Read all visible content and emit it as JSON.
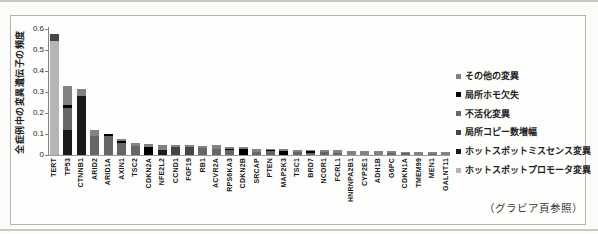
{
  "page": {
    "caption": "（グラビア頁参照）"
  },
  "chart_data": {
    "type": "bar",
    "stacked": true,
    "title": "",
    "xlabel": "",
    "ylabel": "全症例中の変異遺伝子の頻度",
    "ylim": [
      0,
      0.6
    ],
    "yticks": [
      0,
      0.1,
      0.2,
      0.3,
      0.4,
      0.5,
      0.6
    ],
    "grid": false,
    "legend_position": "right",
    "categories": [
      "TERT",
      "TP53",
      "CTNNB1",
      "ARID2",
      "ARID1A",
      "AXIN1",
      "TSC2",
      "CDKN2A",
      "NFE2L2",
      "CCND1",
      "FGF19",
      "RB1",
      "ACVR2A",
      "RPS6KA3",
      "CDKN2B",
      "SRCAP",
      "PTEN",
      "MAP2K3",
      "TSC1",
      "BRD7",
      "NCOR1",
      "FCRL1",
      "HNRNPA2B1",
      "CYP2E1",
      "ADH1B",
      "G6PC",
      "CDKN1A",
      "TMEM99",
      "MEN1",
      "GALNT11"
    ],
    "series": [
      {
        "name": "ホットスポットプロモータ変異",
        "color": "#b5b5b5",
        "values": [
          0.545,
          0,
          0,
          0,
          0,
          0,
          0,
          0,
          0,
          0,
          0,
          0,
          0,
          0,
          0,
          0,
          0,
          0,
          0,
          0,
          0,
          0,
          0,
          0,
          0,
          0,
          0,
          0,
          0,
          0
        ]
      },
      {
        "name": "ホットスポットミスセンス変異",
        "color": "#1a1a1a",
        "values": [
          0,
          0.12,
          0.28,
          0,
          0,
          0,
          0,
          0,
          0.025,
          0,
          0,
          0,
          0,
          0,
          0,
          0,
          0,
          0,
          0,
          0,
          0,
          0,
          0,
          0,
          0,
          0,
          0,
          0,
          0,
          0
        ]
      },
      {
        "name": "局所コピー数増幅",
        "color": "#454545",
        "values": [
          0.03,
          0,
          0,
          0,
          0,
          0,
          0,
          0,
          0,
          0.04,
          0.04,
          0,
          0,
          0,
          0,
          0,
          0,
          0,
          0,
          0,
          0,
          0,
          0,
          0,
          0,
          0,
          0,
          0,
          0,
          0
        ]
      },
      {
        "name": "不活化変異",
        "color": "#666666",
        "values": [
          0,
          0.105,
          0,
          0.09,
          0.09,
          0.055,
          0.045,
          0,
          0,
          0,
          0,
          0.035,
          0.03,
          0.025,
          0,
          0.015,
          0.02,
          0,
          0.015,
          0.01,
          0.012,
          0.01,
          0,
          0,
          0,
          0.01,
          0.008,
          0,
          0.007,
          0
        ]
      },
      {
        "name": "局所ホモ欠失",
        "color": "#000000",
        "values": [
          0,
          0.015,
          0,
          0,
          0.01,
          0.01,
          0,
          0.04,
          0,
          0,
          0,
          0,
          0,
          0.005,
          0.03,
          0,
          0.005,
          0.02,
          0,
          0.008,
          0,
          0,
          0,
          0,
          0,
          0,
          0,
          0,
          0,
          0
        ]
      },
      {
        "name": "その他の変異",
        "color": "#828282",
        "values": [
          0,
          0.09,
          0.035,
          0.03,
          0,
          0.01,
          0.01,
          0.013,
          0.025,
          0.01,
          0.01,
          0.01,
          0.016,
          0.01,
          0.007,
          0.015,
          0.004,
          0.009,
          0.009,
          0.005,
          0.01,
          0.012,
          0.021,
          0.02,
          0.019,
          0.008,
          0.008,
          0.015,
          0.007,
          0.013
        ]
      }
    ]
  }
}
